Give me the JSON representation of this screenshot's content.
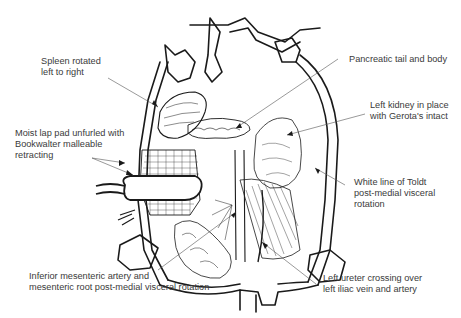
{
  "figure": {
    "type": "surgical-illustration",
    "line_color": "#1a1a1a",
    "label_color": "#3a3a3a",
    "leader_color": "#555555"
  },
  "labels": [
    {
      "id": "spleen",
      "lines": [
        "Spleen rotated",
        "left to right"
      ]
    },
    {
      "id": "lap-pad",
      "lines": [
        "Moist lap pad unfurled with",
        "Bookwalter malleable",
        "retracting"
      ]
    },
    {
      "id": "pancreas",
      "lines": [
        "Pancreatic tail and body"
      ]
    },
    {
      "id": "kidney",
      "lines": [
        "Left kidney in place",
        "with Gerota's intact"
      ]
    },
    {
      "id": "toldt",
      "lines": [
        "White line of Toldt",
        "post-medial visceral",
        "rotation"
      ]
    },
    {
      "id": "ima",
      "lines": [
        "Inferior mesenteric artery and",
        "mesenteric root post-medial visceral rotation"
      ]
    },
    {
      "id": "ureter",
      "lines": [
        "Left ureter crossing over",
        "left iliac vein and artery"
      ]
    }
  ]
}
